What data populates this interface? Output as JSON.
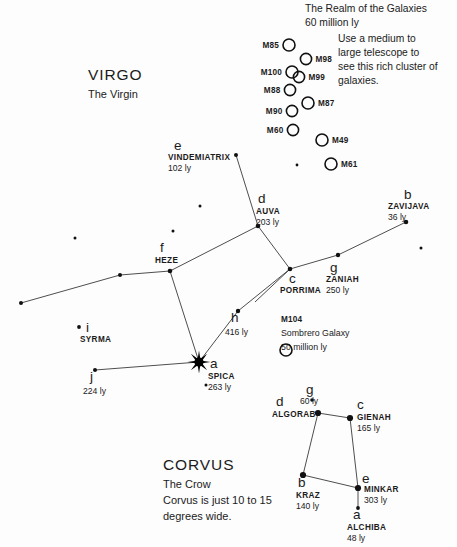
{
  "chart_data": {
    "type": "scatter",
    "xlabel": "",
    "ylabel": "",
    "xlim": [
      0,
      457
    ],
    "ylim": [
      0,
      547
    ],
    "grid": false,
    "legend": "none",
    "series": [
      {
        "name": "Virgo named stars",
        "points": [
          {
            "label": "VINDEMIATRIX",
            "greek": "e",
            "distance": "102 ly",
            "x": 236,
            "y": 155,
            "size": 2.0
          },
          {
            "label": "AUVA",
            "greek": "d",
            "distance": "203 ly",
            "x": 258,
            "y": 226,
            "size": 2.3
          },
          {
            "label": "ZAVIJAVA",
            "greek": "b",
            "distance": "36 ly",
            "x": 406,
            "y": 222,
            "size": 2.3
          },
          {
            "label": "HEZE",
            "greek": "f",
            "distance": "",
            "x": 170,
            "y": 271,
            "size": 2.3
          },
          {
            "label": "PORRIMA",
            "greek": "c",
            "distance": "",
            "x": 290,
            "y": 269,
            "size": 2.3
          },
          {
            "label": "ZANIAH",
            "greek": "g",
            "distance": "250 ly",
            "x": 338,
            "y": 255,
            "size": 2.2
          },
          {
            "label": "",
            "greek": "h",
            "distance": "416 ly",
            "x": 238,
            "y": 311,
            "size": 2.2
          },
          {
            "label": "SPICA",
            "greek": "a",
            "distance": "263 ly",
            "x": 199,
            "y": 362,
            "size": 0
          },
          {
            "label": "SYRMA",
            "greek": "i",
            "distance": "",
            "x": 79,
            "y": 327,
            "size": 1.9
          },
          {
            "label": "",
            "greek": "j",
            "distance": "224 ly",
            "x": 95,
            "y": 370,
            "size": 2.0
          }
        ]
      },
      {
        "name": "Corvus named stars",
        "points": [
          {
            "label": "ALGORAB",
            "greek": "d",
            "distance": "",
            "x": 318,
            "y": 413,
            "size": 3.1
          },
          {
            "label": "GIENAH",
            "greek": "c",
            "distance": "165 ly",
            "x": 350,
            "y": 418,
            "size": 3.1
          },
          {
            "label": "KRAZ",
            "greek": "b",
            "distance": "140 ly",
            "x": 303,
            "y": 475,
            "size": 3.1
          },
          {
            "label": "MINKAR",
            "greek": "e",
            "distance": "303 ly",
            "x": 358,
            "y": 488,
            "size": 3.1
          },
          {
            "label": "ALCHIBA",
            "greek": "a",
            "distance": "48 ly",
            "x": 358,
            "y": 508,
            "size": 1.9
          },
          {
            "label": "",
            "greek": "g",
            "distance": "60 ly",
            "x": 312,
            "y": 400,
            "size": 1.8
          }
        ]
      },
      {
        "name": "Faint unlabeled stars",
        "points": [
          {
            "x": 75,
            "y": 238,
            "size": 1.5
          },
          {
            "x": 173,
            "y": 231,
            "size": 1.5
          },
          {
            "x": 200,
            "y": 206,
            "size": 1.5
          },
          {
            "x": 120,
            "y": 275,
            "size": 2.0
          },
          {
            "x": 21,
            "y": 303,
            "size": 2.0
          },
          {
            "x": 421,
            "y": 248,
            "size": 1.5
          },
          {
            "x": 206,
            "y": 385,
            "size": 1.5
          },
          {
            "x": 297,
            "y": 165,
            "size": 1.4
          }
        ]
      }
    ],
    "constellation_lines": [
      {
        "name": "vindemiatrix-auva",
        "points": [
          [
            236,
            155
          ],
          [
            258,
            226
          ]
        ]
      },
      {
        "name": "auva-porrima",
        "points": [
          [
            258,
            226
          ],
          [
            290,
            269
          ]
        ]
      },
      {
        "name": "auva-heze",
        "points": [
          [
            258,
            226
          ],
          [
            170,
            271
          ]
        ]
      },
      {
        "name": "porrima-zaniah-zavijava",
        "points": [
          [
            290,
            269
          ],
          [
            338,
            255
          ],
          [
            406,
            222
          ]
        ]
      },
      {
        "name": "porrima-h-spica",
        "points": [
          [
            290,
            269
          ],
          [
            238,
            311
          ],
          [
            199,
            362
          ]
        ]
      },
      {
        "name": "heze-spica",
        "points": [
          [
            170,
            271
          ],
          [
            199,
            362
          ]
        ]
      },
      {
        "name": "heze-chain-west",
        "points": [
          [
            170,
            271
          ],
          [
            120,
            275
          ],
          [
            21,
            303
          ]
        ]
      },
      {
        "name": "spica-j",
        "points": [
          [
            199,
            362
          ],
          [
            95,
            370
          ]
        ]
      },
      {
        "name": "porrima-southwest-ray",
        "points": [
          [
            290,
            269
          ],
          [
            255,
            302
          ]
        ]
      },
      {
        "name": "corvus-algorab-gienah",
        "points": [
          [
            318,
            413
          ],
          [
            350,
            418
          ]
        ]
      },
      {
        "name": "corvus-algorab-kraz",
        "points": [
          [
            318,
            413
          ],
          [
            303,
            475
          ]
        ]
      },
      {
        "name": "corvus-gienah-minkar",
        "points": [
          [
            350,
            418
          ],
          [
            358,
            488
          ]
        ]
      },
      {
        "name": "corvus-kraz-minkar",
        "points": [
          [
            303,
            475
          ],
          [
            358,
            488
          ]
        ]
      },
      {
        "name": "minkar-alchiba",
        "points": [
          [
            358,
            488
          ],
          [
            358,
            508
          ]
        ]
      }
    ],
    "galaxies": [
      {
        "label": "M85",
        "x": 289,
        "y": 45,
        "r": 6.0,
        "label_side": "left"
      },
      {
        "label": "M98",
        "x": 306,
        "y": 59,
        "r": 5.6,
        "label_side": "right"
      },
      {
        "label": "M100",
        "x": 292,
        "y": 72,
        "r": 6.0,
        "label_side": "left"
      },
      {
        "label": "M99",
        "x": 299,
        "y": 77,
        "r": 5.6,
        "label_side": "right"
      },
      {
        "label": "M88",
        "x": 290,
        "y": 90,
        "r": 5.6,
        "label_side": "left"
      },
      {
        "label": "M87",
        "x": 308,
        "y": 103,
        "r": 6.0,
        "label_side": "right"
      },
      {
        "label": "M90",
        "x": 292,
        "y": 111,
        "r": 5.6,
        "label_side": "left"
      },
      {
        "label": "M60",
        "x": 293,
        "y": 130,
        "r": 5.6,
        "label_side": "left"
      },
      {
        "label": "M49",
        "x": 322,
        "y": 140,
        "r": 6.0,
        "label_side": "right"
      },
      {
        "label": "M61",
        "x": 331,
        "y": 164,
        "r": 6.0,
        "label_side": "right"
      }
    ]
  },
  "annotations": {
    "realm": {
      "line1": "The Realm of the Galaxies",
      "line2": "60 million ly",
      "x": 305,
      "y": 12
    },
    "telescope_note": {
      "line1": "Use a medium to",
      "line2": "large telescope to",
      "line3": "see this rich cluster of",
      "line4": "galaxies.",
      "x": 338,
      "y": 42
    },
    "m104": {
      "line1": "M104",
      "line2": "Sombrero Galaxy",
      "line3": "50 million ly",
      "x": 281,
      "y": 322,
      "circle": {
        "x": 286,
        "y": 350,
        "r": 6.0
      }
    }
  },
  "constellations": {
    "virgo": {
      "name": "VIRGO",
      "subtitle": "The Virgin",
      "x": 88,
      "y": 80
    },
    "corvus": {
      "name": "CORVUS",
      "subtitle": "The Crow",
      "note1": "Corvus is just 10 to 15",
      "note2": "degrees wide.",
      "x": 163,
      "y": 470
    }
  }
}
